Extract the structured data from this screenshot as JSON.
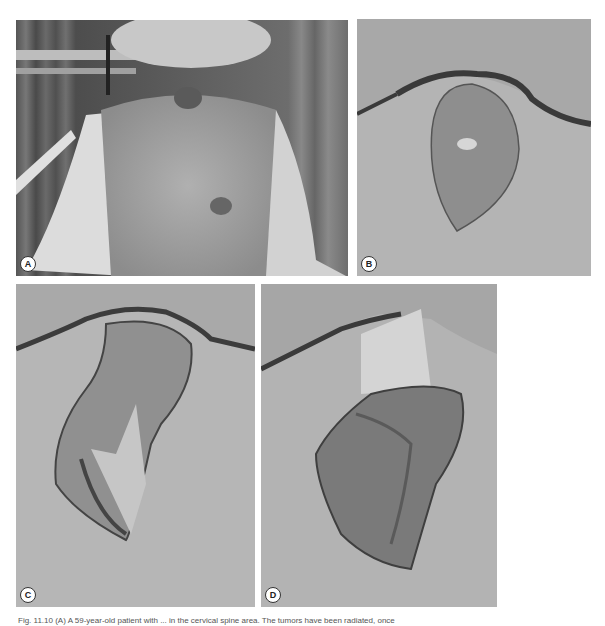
{
  "figure": {
    "panels": [
      {
        "id": "A",
        "label": "A",
        "description": "Patient's back with tumors at cervical spine and mid-back"
      },
      {
        "id": "B",
        "label": "B",
        "description": "Elliptical excision outline near neck"
      },
      {
        "id": "C",
        "label": "C",
        "description": "Flap dissection with rotation flap"
      },
      {
        "id": "D",
        "label": "D",
        "description": "Flap rotated into defect"
      }
    ],
    "caption": "Fig. 11.10 (A) A 59-year-old patient with ... in the cervical spine area. The tumors have been radiated, once"
  }
}
